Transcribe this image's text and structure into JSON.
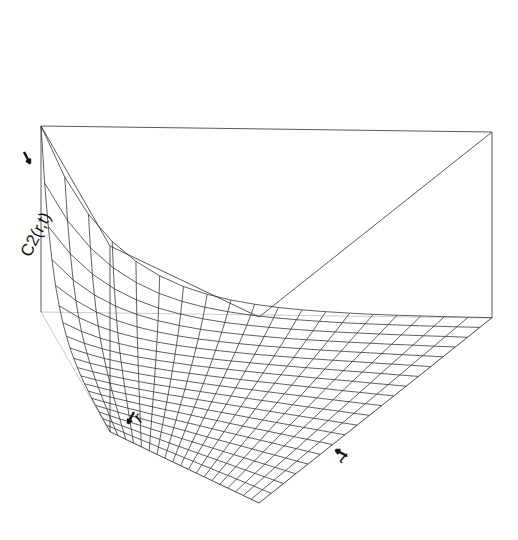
{
  "figure": {
    "type": "3d-surface-wireframe",
    "background_color": "#ffffff",
    "line_color": "#2b2b2b",
    "box_color": "#5a5a5a",
    "width": 518,
    "height": 540
  },
  "axes": {
    "z": {
      "label": "C2(r,t)",
      "label_rotation_deg": -63,
      "tick_arrow": true
    },
    "x": {
      "label": "r",
      "label_rotation_deg": -40,
      "tick_arrow": true
    },
    "y": {
      "label": "t",
      "label_rotation_deg": 40,
      "tick_arrow": true
    }
  },
  "chart_data": {
    "type": "surface",
    "title": "",
    "xlabel": "r",
    "ylabel": "t",
    "zlabel": "C2(r,t)",
    "grid": true,
    "legend": null,
    "x": [
      0,
      0.0526,
      0.1053,
      0.1579,
      0.2105,
      0.2632,
      0.3158,
      0.3684,
      0.4211,
      0.4737,
      0.5263,
      0.5789,
      0.6316,
      0.6842,
      0.7368,
      0.7895,
      0.8421,
      0.8947,
      0.9474,
      1
    ],
    "y": [
      0,
      0.0526,
      0.1053,
      0.1579,
      0.2105,
      0.2632,
      0.3158,
      0.3684,
      0.4211,
      0.4737,
      0.5263,
      0.5789,
      0.6316,
      0.6842,
      0.7368,
      0.7895,
      0.8421,
      0.8947,
      0.9474,
      1
    ],
    "xlim": [
      0,
      1
    ],
    "ylim": [
      0,
      1
    ],
    "zlim": [
      0,
      1
    ],
    "surface_function": "z = exp(-6*x) * exp(-6*y)",
    "z_corner_values": {
      "x0_y0": 1.0,
      "x0_y1": 0.0025,
      "x1_y0": 0.0025,
      "x1_y1": 0.0
    },
    "z_rows": [
      [
        1.0,
        0.727,
        0.528,
        0.384,
        0.279,
        0.203,
        0.147,
        0.107,
        0.078,
        0.057,
        0.041,
        0.03,
        0.022,
        0.016,
        0.011,
        0.008,
        0.006,
        0.004,
        0.003,
        0.002
      ],
      [
        0.727,
        0.528,
        0.384,
        0.279,
        0.203,
        0.147,
        0.107,
        0.078,
        0.057,
        0.041,
        0.03,
        0.022,
        0.016,
        0.011,
        0.008,
        0.006,
        0.004,
        0.003,
        0.002,
        0.002
      ],
      [
        0.528,
        0.384,
        0.279,
        0.203,
        0.147,
        0.107,
        0.078,
        0.057,
        0.041,
        0.03,
        0.022,
        0.016,
        0.011,
        0.008,
        0.006,
        0.004,
        0.003,
        0.002,
        0.002,
        0.001
      ],
      [
        0.384,
        0.279,
        0.203,
        0.147,
        0.107,
        0.078,
        0.057,
        0.041,
        0.03,
        0.022,
        0.016,
        0.011,
        0.008,
        0.006,
        0.004,
        0.003,
        0.002,
        0.002,
        0.001,
        0.001
      ],
      [
        0.279,
        0.203,
        0.147,
        0.107,
        0.078,
        0.057,
        0.041,
        0.03,
        0.022,
        0.016,
        0.011,
        0.008,
        0.006,
        0.004,
        0.003,
        0.002,
        0.002,
        0.001,
        0.001,
        0.001
      ],
      [
        0.203,
        0.147,
        0.107,
        0.078,
        0.057,
        0.041,
        0.03,
        0.022,
        0.016,
        0.011,
        0.008,
        0.006,
        0.004,
        0.003,
        0.002,
        0.002,
        0.001,
        0.001,
        0.001,
        0.0
      ],
      [
        0.147,
        0.107,
        0.078,
        0.057,
        0.041,
        0.03,
        0.022,
        0.016,
        0.011,
        0.008,
        0.006,
        0.004,
        0.003,
        0.002,
        0.002,
        0.001,
        0.001,
        0.001,
        0.0,
        0.0
      ],
      [
        0.107,
        0.078,
        0.057,
        0.041,
        0.03,
        0.022,
        0.016,
        0.011,
        0.008,
        0.006,
        0.004,
        0.003,
        0.002,
        0.002,
        0.001,
        0.001,
        0.001,
        0.0,
        0.0,
        0.0
      ],
      [
        0.078,
        0.057,
        0.041,
        0.03,
        0.022,
        0.016,
        0.011,
        0.008,
        0.006,
        0.004,
        0.003,
        0.002,
        0.002,
        0.001,
        0.001,
        0.001,
        0.0,
        0.0,
        0.0,
        0.0
      ],
      [
        0.057,
        0.041,
        0.03,
        0.022,
        0.016,
        0.011,
        0.008,
        0.006,
        0.004,
        0.003,
        0.002,
        0.002,
        0.001,
        0.001,
        0.001,
        0.0,
        0.0,
        0.0,
        0.0,
        0.0
      ],
      [
        0.041,
        0.03,
        0.022,
        0.016,
        0.011,
        0.008,
        0.006,
        0.004,
        0.003,
        0.002,
        0.002,
        0.001,
        0.001,
        0.001,
        0.0,
        0.0,
        0.0,
        0.0,
        0.0,
        0.0
      ],
      [
        0.03,
        0.022,
        0.016,
        0.011,
        0.008,
        0.006,
        0.004,
        0.003,
        0.002,
        0.002,
        0.001,
        0.001,
        0.001,
        0.0,
        0.0,
        0.0,
        0.0,
        0.0,
        0.0,
        0.0
      ],
      [
        0.022,
        0.016,
        0.011,
        0.008,
        0.006,
        0.004,
        0.003,
        0.002,
        0.002,
        0.001,
        0.001,
        0.001,
        0.0,
        0.0,
        0.0,
        0.0,
        0.0,
        0.0,
        0.0,
        0.0
      ],
      [
        0.016,
        0.011,
        0.008,
        0.006,
        0.004,
        0.003,
        0.002,
        0.002,
        0.001,
        0.001,
        0.001,
        0.0,
        0.0,
        0.0,
        0.0,
        0.0,
        0.0,
        0.0,
        0.0,
        0.0
      ],
      [
        0.011,
        0.008,
        0.006,
        0.004,
        0.003,
        0.002,
        0.002,
        0.001,
        0.001,
        0.001,
        0.0,
        0.0,
        0.0,
        0.0,
        0.0,
        0.0,
        0.0,
        0.0,
        0.0,
        0.0
      ],
      [
        0.008,
        0.006,
        0.004,
        0.003,
        0.002,
        0.002,
        0.001,
        0.001,
        0.001,
        0.0,
        0.0,
        0.0,
        0.0,
        0.0,
        0.0,
        0.0,
        0.0,
        0.0,
        0.0,
        0.0
      ],
      [
        0.006,
        0.004,
        0.003,
        0.002,
        0.002,
        0.001,
        0.001,
        0.001,
        0.0,
        0.0,
        0.0,
        0.0,
        0.0,
        0.0,
        0.0,
        0.0,
        0.0,
        0.0,
        0.0,
        0.0
      ],
      [
        0.004,
        0.003,
        0.002,
        0.002,
        0.001,
        0.001,
        0.001,
        0.0,
        0.0,
        0.0,
        0.0,
        0.0,
        0.0,
        0.0,
        0.0,
        0.0,
        0.0,
        0.0,
        0.0,
        0.0
      ],
      [
        0.003,
        0.002,
        0.002,
        0.001,
        0.001,
        0.001,
        0.0,
        0.0,
        0.0,
        0.0,
        0.0,
        0.0,
        0.0,
        0.0,
        0.0,
        0.0,
        0.0,
        0.0,
        0.0,
        0.0
      ],
      [
        0.002,
        0.002,
        0.001,
        0.001,
        0.001,
        0.0,
        0.0,
        0.0,
        0.0,
        0.0,
        0.0,
        0.0,
        0.0,
        0.0,
        0.0,
        0.0,
        0.0,
        0.0,
        0.0,
        0.0
      ]
    ]
  }
}
